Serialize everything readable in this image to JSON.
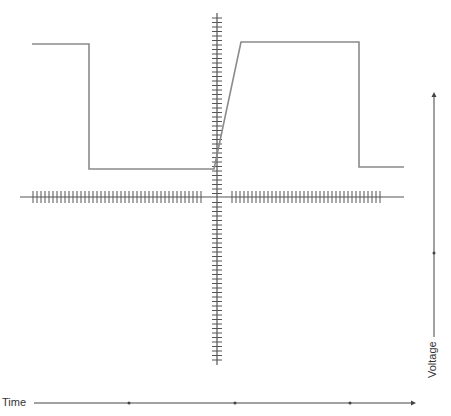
{
  "diagram": {
    "type": "waveform",
    "labels": {
      "time": "Time",
      "voltage": "Voltage"
    },
    "colors": {
      "signal": "#8a8a8a",
      "axis": "#555555",
      "arrow": "#444444",
      "background": "#ffffff"
    },
    "signal_points": [
      [
        32,
        44
      ],
      [
        89,
        44
      ],
      [
        89,
        169
      ],
      [
        214,
        169
      ],
      [
        241,
        42
      ],
      [
        359,
        42
      ],
      [
        359,
        167
      ],
      [
        404,
        167
      ]
    ],
    "crosshair": {
      "vertical": {
        "x": 217,
        "y1": 13,
        "y2": 365,
        "tick_start": 18,
        "tick_end": 360,
        "tick_step": 4.5,
        "tick_half_width": 5
      },
      "horizontal": {
        "y": 197,
        "x1": 20,
        "x2": 404,
        "tick_groups": [
          [
            33,
            203
          ],
          [
            232,
            381
          ]
        ],
        "tick_step": 4,
        "tick_half_height": 6
      }
    },
    "time_arrow": {
      "y": 403,
      "x1": 34,
      "x2": 416,
      "markers": [
        129,
        235,
        350
      ]
    },
    "voltage_arrow": {
      "x": 434,
      "y1": 337,
      "y2": 92,
      "markers": [
        253
      ]
    }
  }
}
